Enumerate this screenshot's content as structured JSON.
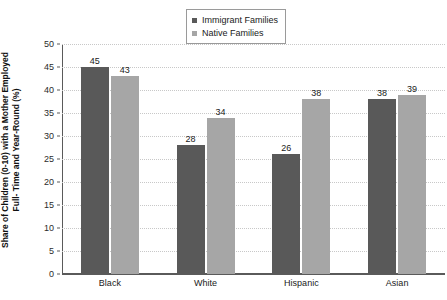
{
  "chart_data": {
    "type": "bar",
    "title": "",
    "subtitle": "",
    "xlabel": "",
    "ylabel": "Share of Children (0-10) with a Mother Employed Full- Time and Year-Round (%)",
    "ylabel_lines": [
      "Share of Children (0-10) with a Mother Employed",
      "Full- Time and Year-Round (%)"
    ],
    "categories": [
      "Black",
      "White",
      "Hispanic",
      "Asian"
    ],
    "series": [
      {
        "name": "Immigrant Families",
        "color": "#595959",
        "values": [
          45,
          28,
          26,
          38
        ]
      },
      {
        "name": "Native Families",
        "color": "#a6a6a6",
        "values": [
          43,
          34,
          38,
          39
        ]
      }
    ],
    "ylim": [
      0,
      50
    ],
    "ytick_step": 5,
    "yticks": [
      0,
      5,
      10,
      15,
      20,
      25,
      30,
      35,
      40,
      45,
      50
    ],
    "ytick_labels": [
      "0",
      "5",
      "10",
      "15",
      "20",
      "25",
      "30",
      "35",
      "40",
      "45",
      "50"
    ],
    "grid": true,
    "grid_style": "dotted",
    "grid_color": "#c8c8c8",
    "legend_position": "top-center",
    "legend_border": true,
    "data_labels": true,
    "background": "#ffffff",
    "axis_color": "#5a5a5a"
  }
}
